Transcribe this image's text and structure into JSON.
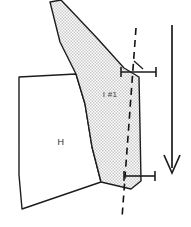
{
  "diagram": {
    "canvas": {
      "width": 191,
      "height": 227,
      "background_color": "#ffffff"
    },
    "colors": {
      "outline": "#1d1d1d",
      "stipple_fill": "#d9d9d9",
      "white_fill": "#ffffff",
      "dashed_line": "#111111",
      "arrow": "#1d1d1d",
      "text": "#2b2b2b"
    },
    "regions": [
      {
        "id": "region-h",
        "label": "H",
        "fill": "white",
        "label_x": 61,
        "label_y": 145
      },
      {
        "id": "region-i1",
        "label": "I #1",
        "fill": "stipple",
        "label_x": 110,
        "label_y": 97
      }
    ],
    "reference_line": {
      "name": "dashed-reference-line",
      "style": "dashed"
    },
    "dimension_marks": [
      {
        "id": "dimension-mark-upper",
        "y": 72
      },
      {
        "id": "dimension-mark-lower",
        "y": 176
      }
    ],
    "direction_arrow": {
      "name": "downward-direction-arrow",
      "orientation": "down",
      "x": 172,
      "y_start": 25,
      "y_end": 173
    }
  }
}
